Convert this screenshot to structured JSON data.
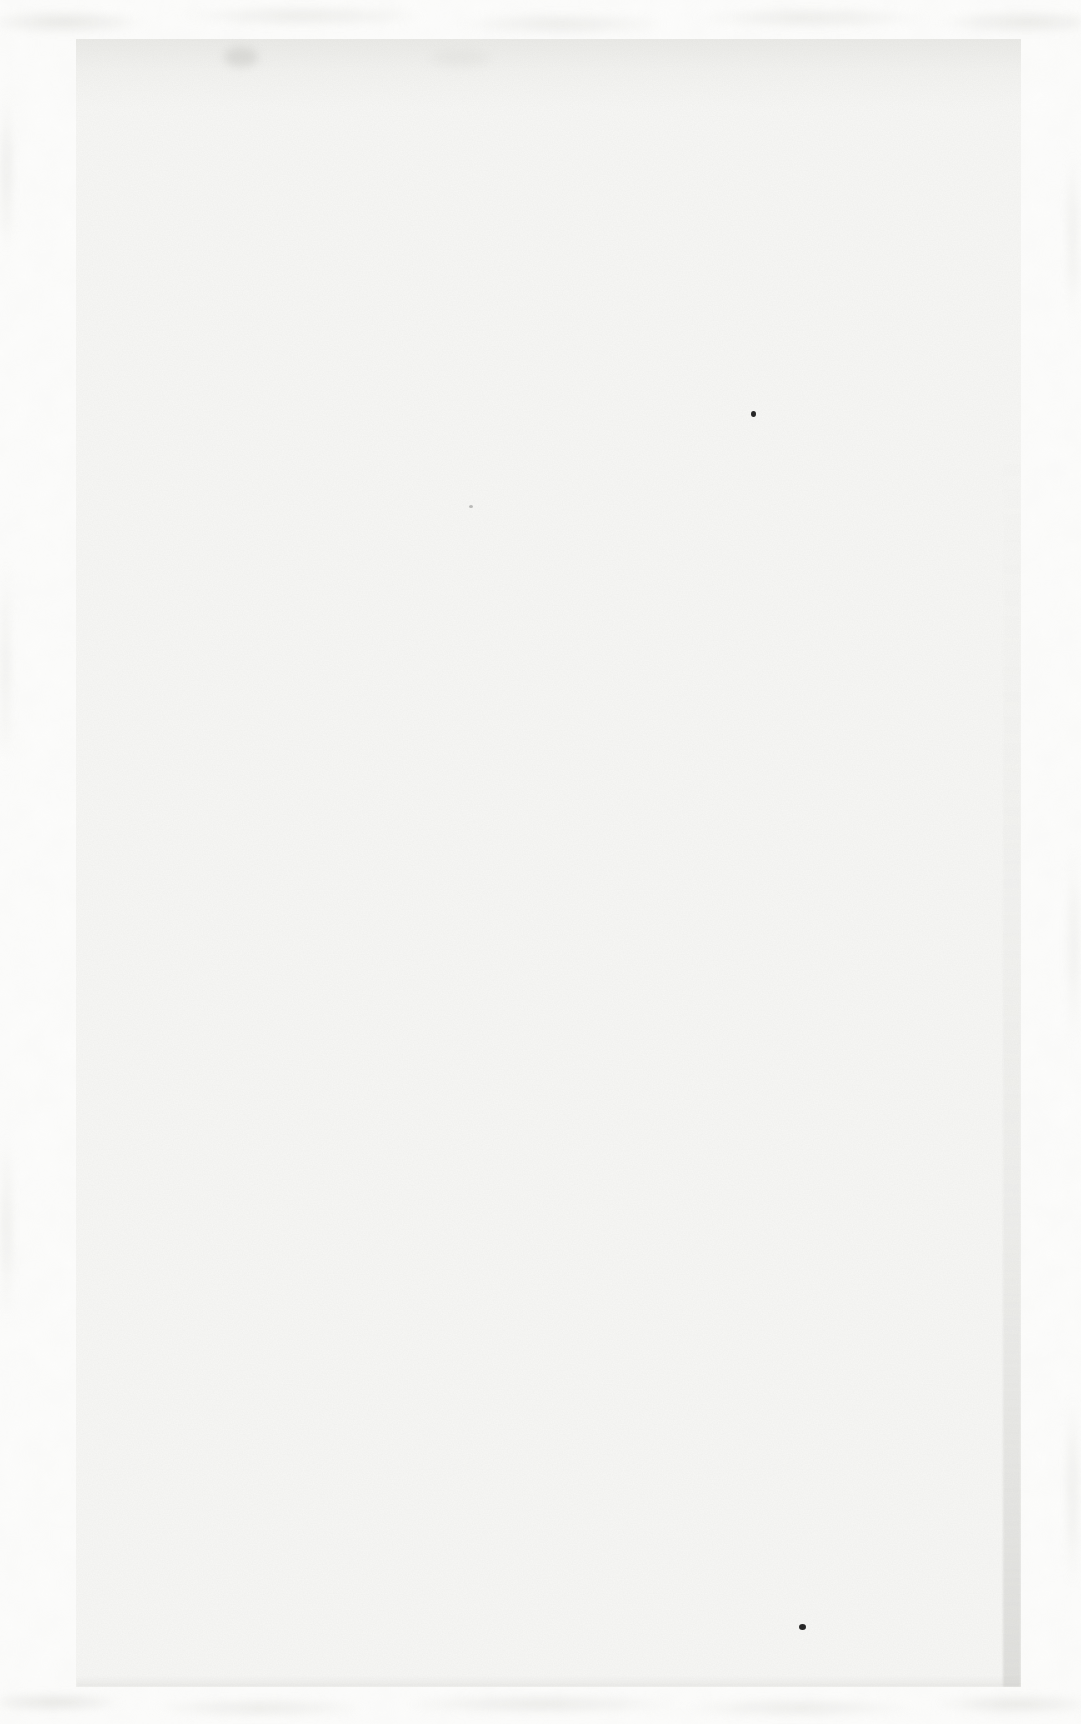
{
  "scan": {
    "description": "Blank scanned book page; no printed text, only paper grain, scanner edge mottling and small ink specks",
    "text_content": "",
    "colors": {
      "margin_background": "#fcfcfb",
      "paper": "#f7f7f5",
      "paper_top_band": "#efefec",
      "edge_mottle": "#cdcdc8",
      "page_edge_shadow": "#bababa",
      "speck_dark": "#141414",
      "speck_faint": "#8a8a88",
      "smudge_gray": "#b9b9b5"
    },
    "artifacts": {
      "specks": [
        {
          "label": "ink-speck-upper",
          "x": 751,
          "y": 411,
          "w": 5,
          "h": 6,
          "color": "#161616",
          "opacity": 0.92,
          "blur": 0.4
        },
        {
          "label": "ink-speck-lower",
          "x": 799,
          "y": 1624,
          "w": 7,
          "h": 6,
          "color": "#161616",
          "opacity": 0.92,
          "blur": 0.5
        },
        {
          "label": "faint-fleck-mid",
          "x": 469,
          "y": 505,
          "w": 4,
          "h": 3,
          "color": "#8a8a88",
          "opacity": 0.55,
          "blur": 0.4
        }
      ],
      "smudges": [
        {
          "label": "gray-smudge-top-left",
          "x": 224,
          "y": 47,
          "w": 34,
          "h": 20,
          "color": "#b9b9b5",
          "opacity": 0.38,
          "blur": 5
        },
        {
          "label": "soft-smudge-top-mid",
          "x": 430,
          "y": 50,
          "w": 60,
          "h": 16,
          "color": "#cfcfcb",
          "opacity": 0.25,
          "blur": 6
        }
      ]
    }
  }
}
